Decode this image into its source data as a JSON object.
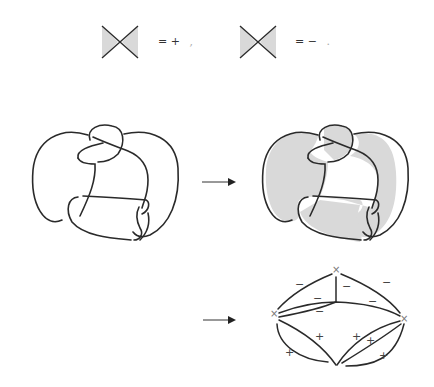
{
  "legend": {
    "positive": {
      "equation": "= +",
      "suffix": ",",
      "shading": "left-right wedges shaded"
    },
    "negative": {
      "equation": "= −",
      "suffix": ".",
      "shading": "left-right wedges shaded"
    }
  },
  "colors": {
    "ink": "#2a2a2a",
    "shade": "#d9d9d9",
    "mark": "#888888"
  },
  "panels": {
    "knot": {
      "description": "knot diagram"
    },
    "checkerboard": {
      "description": "checkerboard-shaded knot diagram"
    },
    "tait_graph": {
      "description": "signed Tait graph",
      "vertex_marker": "×",
      "minus_sign": "−",
      "plus_sign": "+"
    }
  },
  "arrows": [
    "arrow-1",
    "arrow-2"
  ]
}
